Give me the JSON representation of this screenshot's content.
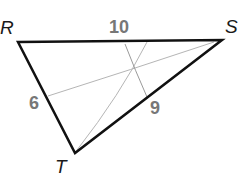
{
  "diagram": {
    "type": "triangle",
    "vertices": [
      {
        "name": "R",
        "x": 18,
        "y": 42
      },
      {
        "name": "S",
        "x": 222,
        "y": 40
      },
      {
        "name": "T",
        "x": 75,
        "y": 153
      }
    ],
    "side_labels": [
      {
        "side": "RS",
        "value": "10"
      },
      {
        "side": "RT",
        "value": "6"
      },
      {
        "side": "ST",
        "value": "9"
      }
    ],
    "colors": {
      "triangle": "#111111",
      "construction": "#aaaaaa",
      "numbers": "#777777"
    }
  }
}
